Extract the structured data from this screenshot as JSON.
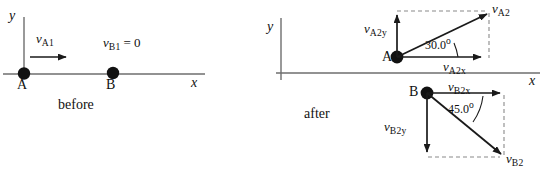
{
  "figure": {
    "stroke_color": "#1a1a1a",
    "axis_color": "#666666",
    "dashed_color": "#888888",
    "text_color": "#111111"
  },
  "before": {
    "phase_label": "before",
    "axis": {
      "x_label": "x",
      "y_label": "y"
    },
    "bodies": [
      {
        "name": "A",
        "label": "A"
      },
      {
        "name": "B",
        "label": "B"
      }
    ],
    "vectors": [
      {
        "name": "v-A1",
        "symbol": "v",
        "subscript": "A1",
        "direction": "right",
        "note": ""
      }
    ],
    "annotations": [
      {
        "name": "v-B1-zero",
        "symbol": "v",
        "subscript": "B1",
        "equals": "= 0"
      }
    ]
  },
  "after": {
    "phase_label": "after",
    "axis": {
      "x_label": "x",
      "y_label": "y"
    },
    "bodies": [
      {
        "name": "A",
        "label": "A"
      },
      {
        "name": "B",
        "label": "B"
      }
    ],
    "vectors": [
      {
        "name": "v-A2",
        "symbol": "v",
        "subscript": "A2"
      },
      {
        "name": "v-A2x",
        "symbol": "v",
        "subscript": "A2x"
      },
      {
        "name": "v-A2y",
        "symbol": "v",
        "subscript": "A2y"
      },
      {
        "name": "v-B2",
        "symbol": "v",
        "subscript": "B2"
      },
      {
        "name": "v-B2x",
        "symbol": "v",
        "subscript": "B2x"
      },
      {
        "name": "v-B2y",
        "symbol": "v",
        "subscript": "B2y"
      }
    ],
    "angles": [
      {
        "name": "angle-A2",
        "value": "30.0",
        "unit": "o"
      },
      {
        "name": "angle-B2",
        "value": "45.0",
        "unit": "o"
      }
    ]
  }
}
